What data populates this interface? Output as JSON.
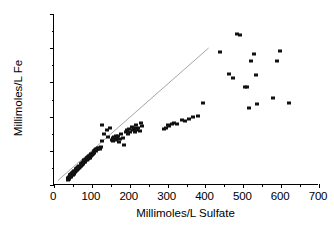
{
  "chart_data": {
    "type": "scatter",
    "title": "",
    "xlabel": "Millimoles/L Sulfate",
    "ylabel": "Millimoles/L Fe",
    "xlim": [
      0,
      700
    ],
    "ylim": [
      0,
      250
    ],
    "xticks": [
      0,
      100,
      200,
      300,
      400,
      500,
      600,
      700
    ],
    "yticks": [
      0,
      50,
      100,
      150,
      200,
      250
    ],
    "x_minor_interval": 50,
    "y_minor_interval": 25,
    "grid": false,
    "legend": null,
    "series": [
      {
        "name": "Fe vs Sulfate",
        "marker": "filled-square",
        "color": "#111111",
        "points": [
          [
            36,
            8
          ],
          [
            38,
            10
          ],
          [
            39,
            12
          ],
          [
            40,
            9
          ],
          [
            41,
            14
          ],
          [
            42,
            11
          ],
          [
            43,
            15
          ],
          [
            44,
            13
          ],
          [
            45,
            16
          ],
          [
            46,
            12
          ],
          [
            47,
            18
          ],
          [
            48,
            15
          ],
          [
            49,
            17
          ],
          [
            50,
            14
          ],
          [
            51,
            19
          ],
          [
            52,
            16
          ],
          [
            53,
            20
          ],
          [
            54,
            18
          ],
          [
            55,
            21
          ],
          [
            56,
            19
          ],
          [
            57,
            23
          ],
          [
            58,
            20
          ],
          [
            59,
            24
          ],
          [
            60,
            22
          ],
          [
            61,
            25
          ],
          [
            62,
            23
          ],
          [
            63,
            26
          ],
          [
            64,
            24
          ],
          [
            65,
            27
          ],
          [
            66,
            25
          ],
          [
            67,
            28
          ],
          [
            68,
            26
          ],
          [
            70,
            30
          ],
          [
            71,
            28
          ],
          [
            72,
            31
          ],
          [
            73,
            29
          ],
          [
            74,
            32
          ],
          [
            75,
            30
          ],
          [
            76,
            33
          ],
          [
            77,
            31
          ],
          [
            78,
            34
          ],
          [
            79,
            33
          ],
          [
            80,
            36
          ],
          [
            81,
            34
          ],
          [
            82,
            37
          ],
          [
            83,
            35
          ],
          [
            84,
            38
          ],
          [
            85,
            36
          ],
          [
            86,
            39
          ],
          [
            87,
            37
          ],
          [
            88,
            40
          ],
          [
            90,
            38
          ],
          [
            91,
            41
          ],
          [
            92,
            39
          ],
          [
            93,
            42
          ],
          [
            94,
            40
          ],
          [
            95,
            43
          ],
          [
            96,
            42
          ],
          [
            97,
            45
          ],
          [
            98,
            43
          ],
          [
            100,
            46
          ],
          [
            101,
            44
          ],
          [
            102,
            47
          ],
          [
            103,
            45
          ],
          [
            105,
            49
          ],
          [
            106,
            47
          ],
          [
            108,
            51
          ],
          [
            110,
            52
          ],
          [
            111,
            50
          ],
          [
            113,
            53
          ],
          [
            115,
            54
          ],
          [
            117,
            52
          ],
          [
            119,
            54
          ],
          [
            121,
            53
          ],
          [
            123,
            55
          ],
          [
            126,
            64
          ],
          [
            128,
            87
          ],
          [
            133,
            75
          ],
          [
            140,
            80
          ],
          [
            143,
            70
          ],
          [
            148,
            83
          ],
          [
            152,
            66
          ],
          [
            155,
            68
          ],
          [
            157,
            64
          ],
          [
            159,
            70
          ],
          [
            161,
            67
          ],
          [
            163,
            72
          ],
          [
            165,
            66
          ],
          [
            167,
            69
          ],
          [
            170,
            71
          ],
          [
            172,
            63
          ],
          [
            175,
            67
          ],
          [
            178,
            74
          ],
          [
            181,
            68
          ],
          [
            186,
            59
          ],
          [
            190,
            77
          ],
          [
            193,
            80
          ],
          [
            196,
            75
          ],
          [
            199,
            82
          ],
          [
            202,
            78
          ],
          [
            205,
            85
          ],
          [
            208,
            80
          ],
          [
            211,
            83
          ],
          [
            214,
            77
          ],
          [
            217,
            88
          ],
          [
            220,
            81
          ],
          [
            223,
            84
          ],
          [
            226,
            79
          ],
          [
            229,
            90
          ],
          [
            232,
            86
          ],
          [
            290,
            82
          ],
          [
            295,
            84
          ],
          [
            300,
            88
          ],
          [
            305,
            86
          ],
          [
            312,
            89
          ],
          [
            318,
            91
          ],
          [
            326,
            89
          ],
          [
            337,
            95
          ],
          [
            345,
            93
          ],
          [
            356,
            97
          ],
          [
            368,
            99
          ],
          [
            380,
            101
          ],
          [
            393,
            120
          ],
          [
            438,
            195
          ],
          [
            463,
            163
          ],
          [
            472,
            156
          ],
          [
            483,
            221
          ],
          [
            492,
            220
          ],
          [
            505,
            143
          ],
          [
            510,
            144
          ],
          [
            516,
            112
          ],
          [
            521,
            181
          ],
          [
            527,
            191
          ],
          [
            533,
            161
          ],
          [
            537,
            119
          ],
          [
            578,
            127
          ],
          [
            588,
            181
          ],
          [
            597,
            196
          ],
          [
            621,
            120
          ]
        ]
      }
    ],
    "annotations": [
      {
        "type": "reference-line",
        "from": [
          10,
          5
        ],
        "to": [
          410,
          200
        ],
        "color": "#9a9a9a",
        "note": "1:2 Fe:Sulfate stoichiometric line"
      }
    ]
  }
}
